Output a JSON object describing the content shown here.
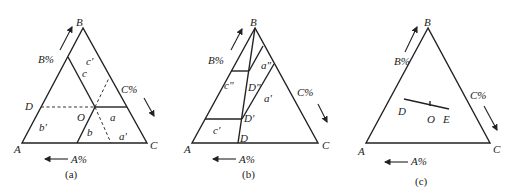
{
  "figure": {
    "panels": [
      {
        "id": "a",
        "caption": "(a)",
        "vertices": {
          "top": "B",
          "left": "A",
          "right": "C"
        },
        "axis_labels": {
          "left_side": "B%",
          "right_side": "C%",
          "bottom": "A%"
        },
        "points": {
          "D": "D",
          "O": "O"
        },
        "regions": [
          "c'",
          "c",
          "a",
          "a'",
          "b",
          "b'"
        ]
      },
      {
        "id": "b",
        "caption": "(b)",
        "vertices": {
          "top": "B",
          "left": "A",
          "right": "C"
        },
        "axis_labels": {
          "left_side": "B%",
          "right_side": "C%",
          "bottom": "A%"
        },
        "points": {
          "D": "D",
          "D1": "D'",
          "D2": "D\""
        },
        "regions": [
          "c\"",
          "c'",
          "a\"",
          "a'"
        ]
      },
      {
        "id": "c",
        "caption": "(c)",
        "vertices": {
          "top": "B",
          "left": "A",
          "right": "C"
        },
        "axis_labels": {
          "left_side": "B%",
          "right_side": "C%",
          "bottom": "A%"
        },
        "points": {
          "D": "D",
          "O": "O",
          "E": "E"
        }
      }
    ],
    "colors": {
      "line": "#222222",
      "background": "#ffffff"
    }
  }
}
